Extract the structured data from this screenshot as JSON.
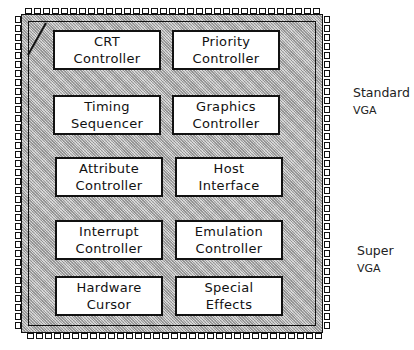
{
  "diagram": {
    "type": "chip-block-diagram",
    "chip": {
      "shape": "square IC package with pins on all four sides, beveled top-left corner",
      "fill": "#c8c8c8",
      "outline": "#111111"
    },
    "blocks": [
      {
        "id": "crt",
        "line1": "CRT",
        "line2": "Controller",
        "row": 1,
        "col": 1
      },
      {
        "id": "priority",
        "line1": "Priority",
        "line2": "Controller",
        "row": 1,
        "col": 2
      },
      {
        "id": "timing",
        "line1": "Timing",
        "line2": "Sequencer",
        "row": 2,
        "col": 1
      },
      {
        "id": "graphics",
        "line1": "Graphics",
        "line2": "Controller",
        "row": 2,
        "col": 2
      },
      {
        "id": "attribute",
        "line1": "Attribute",
        "line2": "Controller",
        "row": 3,
        "col": 1
      },
      {
        "id": "host",
        "line1": "Host",
        "line2": "Interface",
        "row": 3,
        "col": 2
      },
      {
        "id": "interrupt",
        "line1": "Interrupt",
        "line2": "Controller",
        "row": 4,
        "col": 1
      },
      {
        "id": "emulation",
        "line1": "Emulation",
        "line2": "Controller",
        "row": 4,
        "col": 2
      },
      {
        "id": "hardware-cursor",
        "line1": "Hardware",
        "line2": "Cursor",
        "row": 5,
        "col": 1
      },
      {
        "id": "special-effects",
        "line1": "Special",
        "line2": "Effects",
        "row": 5,
        "col": 2
      }
    ],
    "side_labels": [
      {
        "id": "standard-vga",
        "line1": "Standard",
        "line2": "VGA"
      },
      {
        "id": "super-vga",
        "line1": "Super",
        "line2": "VGA"
      }
    ]
  }
}
